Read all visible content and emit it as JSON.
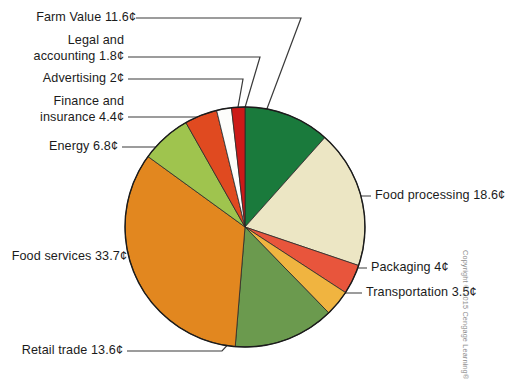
{
  "figure": {
    "background_color": "#ffffff",
    "credit": "Copyright © 2015 Cengage Learning®",
    "outline_color": "#1b1b1b",
    "leader_color": "#3a3a3a"
  },
  "chart_data": {
    "type": "pie",
    "title": "",
    "xlabel": "",
    "ylabel": "",
    "unit": "¢",
    "total": 100,
    "legend_position": "callout-labels",
    "grid": false,
    "start_angle_deg": 0,
    "direction": "clockwise",
    "categories": [
      "Farm Value",
      "Food processing",
      "Packaging",
      "Transportation",
      "Retail trade",
      "Food services",
      "Energy",
      "Finance and insurance",
      "Advertising",
      "Legal and accounting"
    ],
    "values": [
      11.6,
      18.6,
      4,
      3.5,
      13.6,
      33.7,
      6.8,
      4.4,
      2,
      1.8
    ],
    "colors": [
      "#1a7a3c",
      "#ece6c4",
      "#e8553c",
      "#f0b440",
      "#6b9a4e",
      "#e2871f",
      "#9fc44e",
      "#e04a20",
      "#fdfdfb",
      "#cc1a18"
    ],
    "labels": [
      "Farm Value 11.6¢",
      "Food processing 18.6¢",
      "Packaging 4¢",
      "Transportation 3.5¢",
      "Retail trade 13.6¢",
      "Food services 33.7¢",
      "Energy 6.8¢",
      "Finance and\ninsurance 4.4¢",
      "Advertising 2¢",
      "Legal and\naccounting 1.8¢"
    ]
  },
  "callouts": {
    "farm_value": "Farm Value 11.6¢",
    "legal_accounting": "Legal and\naccounting 1.8¢",
    "advertising": "Advertising 2¢",
    "finance_insurance": "Finance and\ninsurance 4.4¢",
    "energy": "Energy 6.8¢",
    "food_services": "Food services 33.7¢",
    "retail_trade": "Retail trade 13.6¢",
    "food_processing": "Food processing 18.6¢",
    "packaging": "Packaging 4¢",
    "transportation": "Transportation 3.5¢"
  }
}
